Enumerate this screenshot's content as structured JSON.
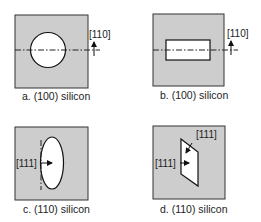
{
  "figure": {
    "panels": [
      {
        "id": "a",
        "caption": "a. (100) silicon",
        "opening_shape": "circle",
        "direction_label": "[110]"
      },
      {
        "id": "b",
        "caption": "b. (100) silicon",
        "opening_shape": "rectangle",
        "direction_label": "[110]"
      },
      {
        "id": "c",
        "caption": "c. (110) silicon",
        "opening_shape": "ellipse",
        "direction_label": "[111]"
      },
      {
        "id": "d",
        "caption": "d. (110) silicon",
        "opening_shape": "parallelogram",
        "direction_labels": [
          "[111]",
          "[111]"
        ]
      }
    ]
  }
}
